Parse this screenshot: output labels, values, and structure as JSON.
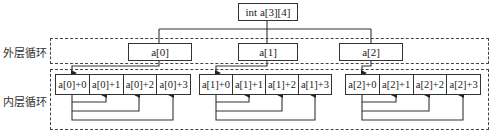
{
  "root": {
    "label": "int a[3][4]"
  },
  "outer_loop": {
    "label": "外层循环",
    "rows": [
      {
        "label": "a[0]"
      },
      {
        "label": "a[1]"
      },
      {
        "label": "a[2]"
      }
    ]
  },
  "inner_loop": {
    "label": "内层循环",
    "groups": [
      {
        "cells": [
          {
            "label": "a[0]+0"
          },
          {
            "label": "a[0]+1"
          },
          {
            "label": "a[0]+2"
          },
          {
            "label": "a[0]+3"
          }
        ]
      },
      {
        "cells": [
          {
            "label": "a[1]+0"
          },
          {
            "label": "a[1]+1"
          },
          {
            "label": "a[1]+2"
          },
          {
            "label": "a[1]+3"
          }
        ]
      },
      {
        "cells": [
          {
            "label": "a[2]+0"
          },
          {
            "label": "a[2]+1"
          },
          {
            "label": "a[2]+2"
          },
          {
            "label": "a[2]+3"
          }
        ]
      }
    ]
  }
}
